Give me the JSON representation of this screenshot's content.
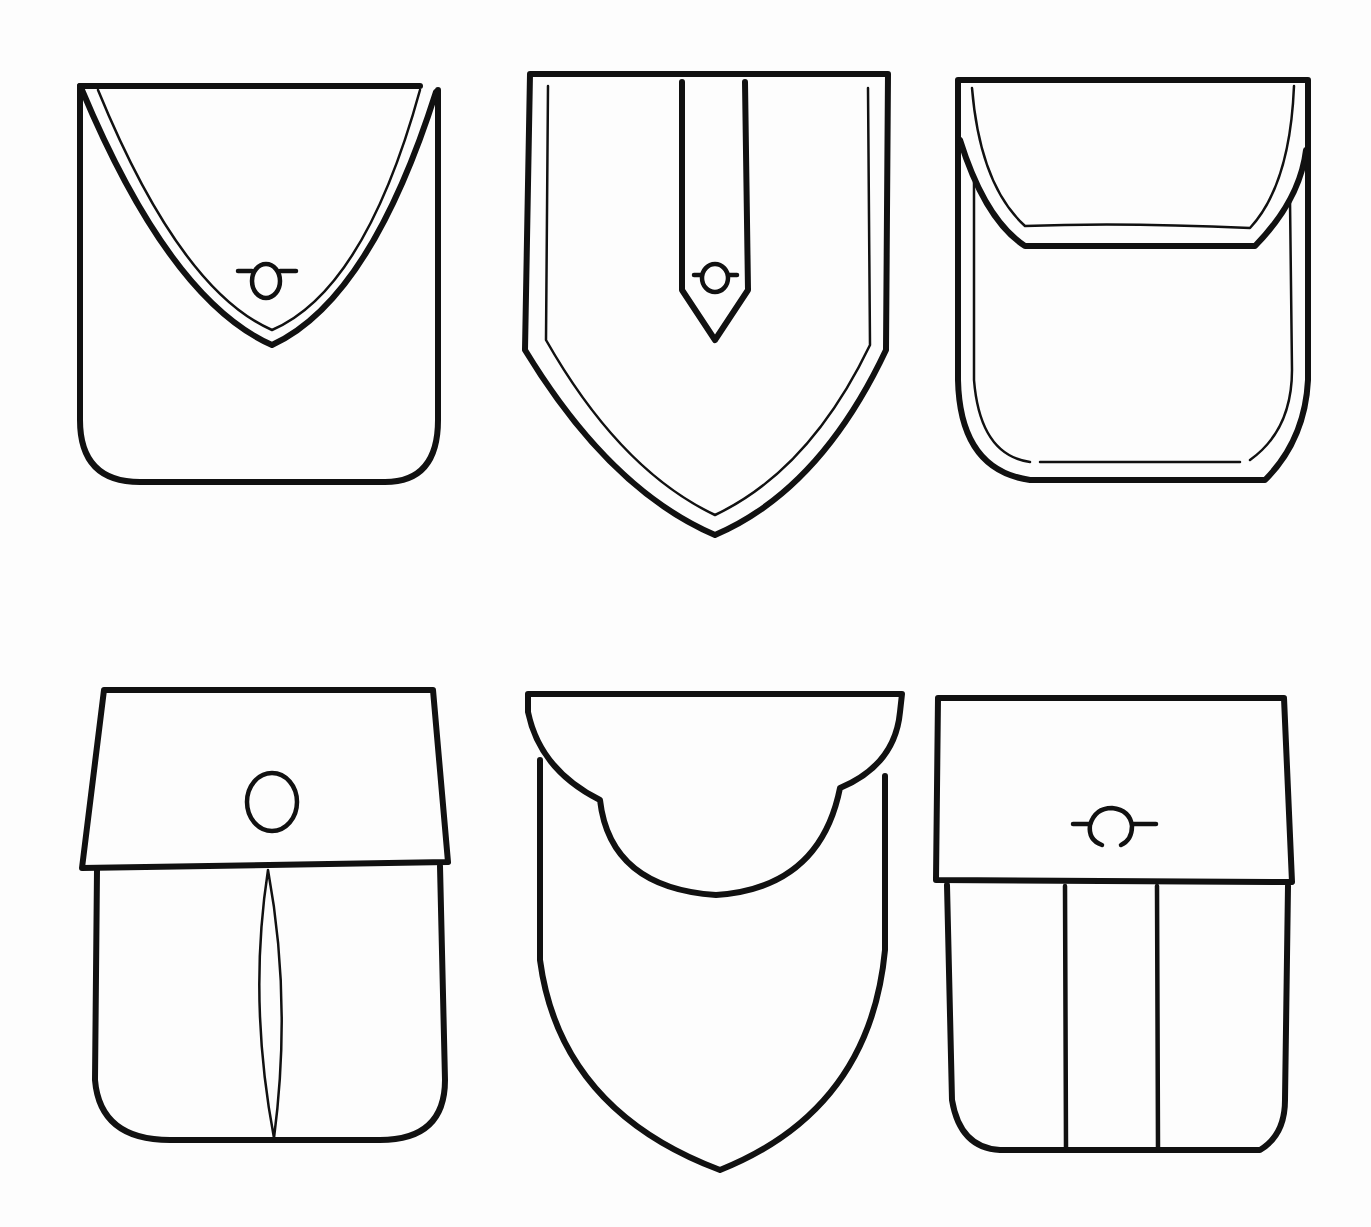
{
  "figure": {
    "background_color": "#fdfdfd",
    "stroke_color": "#111111",
    "pockets": [
      {
        "id": 1,
        "row": 1,
        "col": 1,
        "label": "Pocket with curved pointed flap and button"
      },
      {
        "id": 2,
        "row": 1,
        "col": 2,
        "label": "Shield-shaped pocket with pointed tab and button"
      },
      {
        "id": 3,
        "row": 1,
        "col": 3,
        "label": "Rounded pocket with rounded flap, double stitching"
      },
      {
        "id": 4,
        "row": 2,
        "col": 1,
        "label": "Pocket with trapezoid flap, button and box pleat"
      },
      {
        "id": 5,
        "row": 2,
        "col": 2,
        "label": "Shield pocket with scalloped flap"
      },
      {
        "id": 6,
        "row": 2,
        "col": 3,
        "label": "Pocket with rectangular flap, button and two vertical seams"
      }
    ]
  }
}
